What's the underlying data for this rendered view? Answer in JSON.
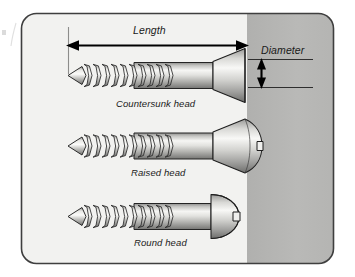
{
  "figure": {
    "background_color": "#ffffff",
    "panel": {
      "fill_light": "#f2f2f0",
      "fill_gray": "#b6b6b4",
      "border_color": "#3b3b3b",
      "divider_x": 247
    }
  },
  "dimensions": {
    "length": {
      "label": "Length",
      "arrow": "double-headed-horizontal"
    },
    "diameter": {
      "label": "Diameter",
      "arrow": "double-headed-vertical"
    }
  },
  "screws": [
    {
      "label": "Countersunk head",
      "head_type": "countersunk",
      "slot": false
    },
    {
      "label": "Raised head",
      "head_type": "raised",
      "slot": true
    },
    {
      "label": "Round head",
      "head_type": "round",
      "slot": true
    }
  ],
  "colors": {
    "metal_light": "#f4f4f2",
    "metal_mid": "#c9c9c6",
    "metal_dark": "#7e7e7c",
    "outline": "#222222",
    "arrow": "#000000"
  }
}
